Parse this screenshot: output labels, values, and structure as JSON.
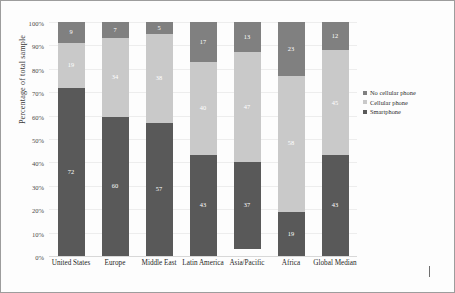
{
  "chart_data": {
    "type": "bar",
    "stacked": true,
    "title": "",
    "xlabel": "",
    "ylabel": "Percentage of total sample",
    "ylim": [
      0,
      100
    ],
    "grid": true,
    "legend_position": "right",
    "categories": [
      "United States",
      "Europe",
      "Middle East",
      "Latin America",
      "Asia/Pacific",
      "Africa",
      "Global Median"
    ],
    "ytick_labels": [
      "100%",
      "90%",
      "80%",
      "70%",
      "60%",
      "50%",
      "40%",
      "30%",
      "20%",
      "10%",
      "0%"
    ],
    "ytick_values": [
      100,
      90,
      80,
      70,
      60,
      50,
      40,
      30,
      20,
      10,
      0
    ],
    "series": [
      {
        "name": "No cellular phone",
        "color": "#808080",
        "values": [
          9,
          7,
          5,
          17,
          13,
          23,
          12
        ]
      },
      {
        "name": "Cellular phone",
        "color": "#c9c9c9",
        "values": [
          19,
          34,
          38,
          40,
          47,
          58,
          45
        ]
      },
      {
        "name": "Smartphone",
        "color": "#595959",
        "values": [
          72,
          60,
          57,
          43,
          37,
          19,
          43
        ]
      }
    ]
  },
  "legend": {
    "items": [
      {
        "label": "No cellular phone",
        "color": "#808080"
      },
      {
        "label": "Cellular phone",
        "color": "#c9c9c9"
      },
      {
        "label": "Smartphone",
        "color": "#595959"
      }
    ]
  }
}
